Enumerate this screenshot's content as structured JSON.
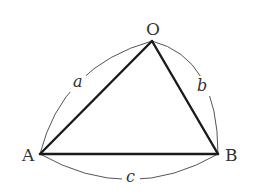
{
  "diagram": {
    "type": "triangle-with-arc-labels",
    "vertices": {
      "O": {
        "label": "O",
        "x": 152,
        "y": 41
      },
      "A": {
        "label": "A",
        "x": 40,
        "y": 154
      },
      "B": {
        "label": "B",
        "x": 218,
        "y": 154
      }
    },
    "sides": {
      "a": {
        "label": "a",
        "from": "A",
        "to": "O"
      },
      "b": {
        "label": "b",
        "from": "O",
        "to": "B"
      },
      "c": {
        "label": "c",
        "from": "A",
        "to": "B"
      }
    },
    "colors": {
      "edge": "#1a1a1a",
      "arc": "#555555",
      "text": "#333333",
      "background": "#ffffff"
    }
  }
}
